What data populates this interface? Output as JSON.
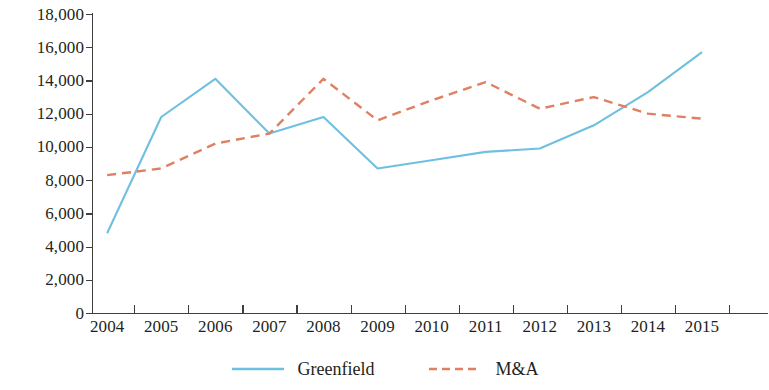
{
  "chart_data": {
    "type": "line",
    "title": "",
    "subtitle": "",
    "xlabel": "",
    "ylabel": "",
    "categories": [
      "2004",
      "2005",
      "2006",
      "2007",
      "2008",
      "2009",
      "2010",
      "2011",
      "2012",
      "2013",
      "2014",
      "2015"
    ],
    "series": [
      {
        "name": "Greenfield",
        "color": "#6FC0E0",
        "style": "solid",
        "values": [
          4800,
          11800,
          14100,
          10800,
          11800,
          8700,
          9200,
          9700,
          9900,
          11300,
          13300,
          15700
        ]
      },
      {
        "name": "M&A",
        "color": "#DE8061",
        "style": "dashed",
        "values": [
          8300,
          8700,
          10200,
          10800,
          14100,
          11600,
          12800,
          13900,
          12300,
          13000,
          12000,
          11700
        ]
      }
    ],
    "ylim": [
      0,
      18000
    ],
    "ytick_values": [
      0,
      2000,
      4000,
      6000,
      8000,
      10000,
      12000,
      14000,
      16000,
      18000
    ],
    "ytick_labels": [
      "0",
      "2,000",
      "4,000",
      "6,000",
      "8,000",
      "10,000",
      "12,000",
      "14,000",
      "16,000",
      "18,000"
    ],
    "grid": false,
    "legend_position": "bottom"
  },
  "legend": {
    "items": [
      {
        "label": "Greenfield",
        "color": "#6FC0E0",
        "style": "solid"
      },
      {
        "label": "M&A",
        "color": "#DE8061",
        "style": "dashed"
      }
    ]
  }
}
